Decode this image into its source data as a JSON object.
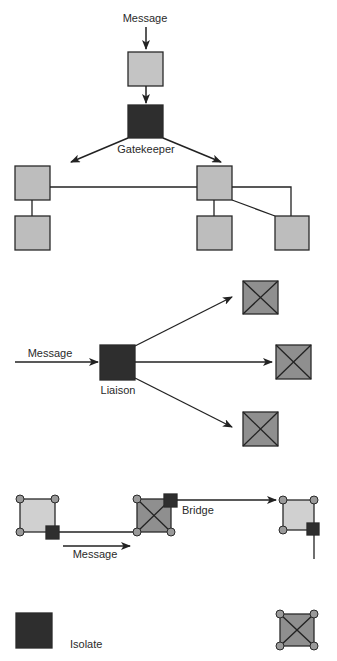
{
  "colors": {
    "light_node": "#c4c4c4",
    "gray_node": "#bdbdbd",
    "dark_node": "#2e2e2e",
    "x_node": "#8f8f8f",
    "bridge_light": "#d0d0d0",
    "corner_dot": "#9a9a9a",
    "line": "#222222"
  },
  "gatekeeper": {
    "message_label": "Message",
    "role_label": "Gatekeeper"
  },
  "liaison": {
    "message_label": "Message",
    "role_label": "Liaison"
  },
  "bridge": {
    "message_label": "Message",
    "role_label": "Bridge"
  },
  "isolate": {
    "role_label": "Isolate"
  }
}
